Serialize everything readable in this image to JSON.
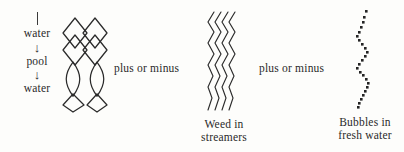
{
  "figure": {
    "background_color": "#fdfdfb",
    "ink_color": "#2b2b2b",
    "sequence": {
      "name": "water-pool-water",
      "items": [
        {
          "type": "tick",
          "label": ""
        },
        {
          "type": "word",
          "label": "water"
        },
        {
          "type": "arrow",
          "label": "↓"
        },
        {
          "type": "word",
          "label": "pool"
        },
        {
          "type": "arrow",
          "label": "↓"
        },
        {
          "type": "word",
          "label": "water"
        }
      ]
    },
    "connectors": [
      {
        "id": "connector-1",
        "label": "plus or minus"
      },
      {
        "id": "connector-2",
        "label": "plus or minus"
      }
    ],
    "elements": [
      {
        "id": "braid",
        "icon": "braided-lattice-icon",
        "caption_lines": []
      },
      {
        "id": "weed",
        "icon": "wavy-streamers-icon",
        "caption_lines": [
          "Weed in",
          "streamers"
        ]
      },
      {
        "id": "bubbles",
        "icon": "bubble-chain-icon",
        "caption_lines": [
          "Bubbles in",
          "fresh water"
        ]
      }
    ]
  }
}
